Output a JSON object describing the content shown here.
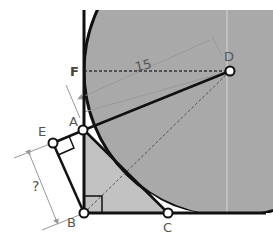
{
  "diagram": {
    "colors": {
      "circle_fill": "#a9a9a9",
      "triangle_fill": "#c4c4c4",
      "line": "#111111",
      "dim_line": "#999999",
      "label": "#555555",
      "background": "#ffffff"
    },
    "points": {
      "A": {
        "label": "A",
        "x": 83,
        "y": 130
      },
      "B": {
        "label": "B",
        "x": 84,
        "y": 213
      },
      "C": {
        "label": "C",
        "x": 168,
        "y": 213
      },
      "D": {
        "label": "D",
        "x": 230,
        "y": 71
      },
      "E": {
        "label": "E",
        "x": 53,
        "y": 143
      },
      "F": {
        "label": "F",
        "x": 83,
        "y": 71
      }
    },
    "circle": {
      "center": "D",
      "radius_label": "15"
    },
    "dimension": {
      "label": "?",
      "between": [
        "E",
        "B"
      ]
    },
    "radius_value": "15",
    "unknown_label": "?"
  }
}
